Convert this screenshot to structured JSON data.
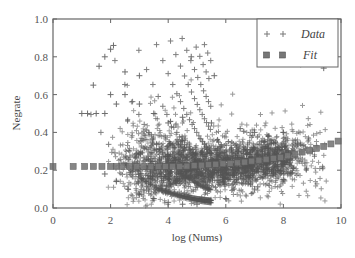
{
  "chart_data": {
    "type": "scatter",
    "title": "",
    "xlabel": "log (Nums)",
    "ylabel": "Negrate",
    "xlim": [
      0,
      10
    ],
    "ylim": [
      0.0,
      1.0
    ],
    "xticks": [
      "0",
      "2",
      "4",
      "6",
      "8",
      "10"
    ],
    "yticks": [
      "0.0",
      "0.2",
      "0.4",
      "0.6",
      "0.8",
      "1.0"
    ],
    "grid": false,
    "legend_position": "upper right",
    "series": [
      {
        "name": "Data",
        "marker": "+",
        "color": "#555555",
        "description": "Dense cloud of points; upper envelope ~0.85 near x=2 decreasing; bulk between 0.1 and 0.4 for x in 3-8; fan-shaped discrete bands at low x",
        "sample_points": [
          [
            1.0,
            0.5
          ],
          [
            1.4,
            0.65
          ],
          [
            1.6,
            0.75
          ],
          [
            1.8,
            0.8
          ],
          [
            2.0,
            0.84
          ],
          [
            2.1,
            0.86
          ],
          [
            2.5,
            0.72
          ],
          [
            3.0,
            0.7
          ],
          [
            4.8,
            0.8
          ],
          [
            5.6,
            0.7
          ],
          [
            8.6,
            0.76
          ],
          [
            9.4,
            0.74
          ],
          [
            1.2,
            0.5
          ],
          [
            1.5,
            0.5
          ],
          [
            1.8,
            0.5
          ],
          [
            2.0,
            0.6
          ],
          [
            2.2,
            0.55
          ],
          [
            2.5,
            0.6
          ],
          [
            3.0,
            0.55
          ],
          [
            3.5,
            0.5
          ],
          [
            4.0,
            0.45
          ],
          [
            4.5,
            0.48
          ],
          [
            5.5,
            0.45
          ],
          [
            6.5,
            0.42
          ],
          [
            7.0,
            0.4
          ],
          [
            7.5,
            0.38
          ],
          [
            8.0,
            0.4
          ],
          [
            8.5,
            0.34
          ],
          [
            9.0,
            0.3
          ],
          [
            1.8,
            0.18
          ],
          [
            2.2,
            0.14
          ],
          [
            2.6,
            0.1
          ],
          [
            3.0,
            0.07
          ],
          [
            3.5,
            0.05
          ],
          [
            4.0,
            0.03
          ],
          [
            4.5,
            0.02
          ],
          [
            5.0,
            0.02
          ],
          [
            6.0,
            0.05
          ],
          [
            7.0,
            0.1
          ],
          [
            8.0,
            0.15
          ]
        ]
      },
      {
        "name": "Fit",
        "marker": "s",
        "color": "#777777",
        "x": [
          0.0,
          0.7,
          1.1,
          1.4,
          1.7,
          2.0,
          2.5,
          3.0,
          3.5,
          4.0,
          4.5,
          5.0,
          5.5,
          6.0,
          6.5,
          7.0,
          7.5,
          8.0,
          8.5,
          9.0,
          9.5,
          10.0
        ],
        "values": [
          0.22,
          0.22,
          0.22,
          0.22,
          0.22,
          0.22,
          0.22,
          0.22,
          0.22,
          0.22,
          0.22,
          0.225,
          0.23,
          0.235,
          0.24,
          0.25,
          0.26,
          0.27,
          0.29,
          0.31,
          0.33,
          0.36
        ]
      }
    ]
  },
  "legend": {
    "items": [
      {
        "label": "Data",
        "marker": "plus"
      },
      {
        "label": "Fit",
        "marker": "square"
      }
    ]
  },
  "axes": {
    "xlabel": "log (Nums)",
    "ylabel": "Negrate",
    "xticks": [
      "0",
      "2",
      "4",
      "6",
      "8",
      "10"
    ],
    "yticks": [
      "0.0",
      "0.2",
      "0.4",
      "0.6",
      "0.8",
      "1.0"
    ]
  }
}
